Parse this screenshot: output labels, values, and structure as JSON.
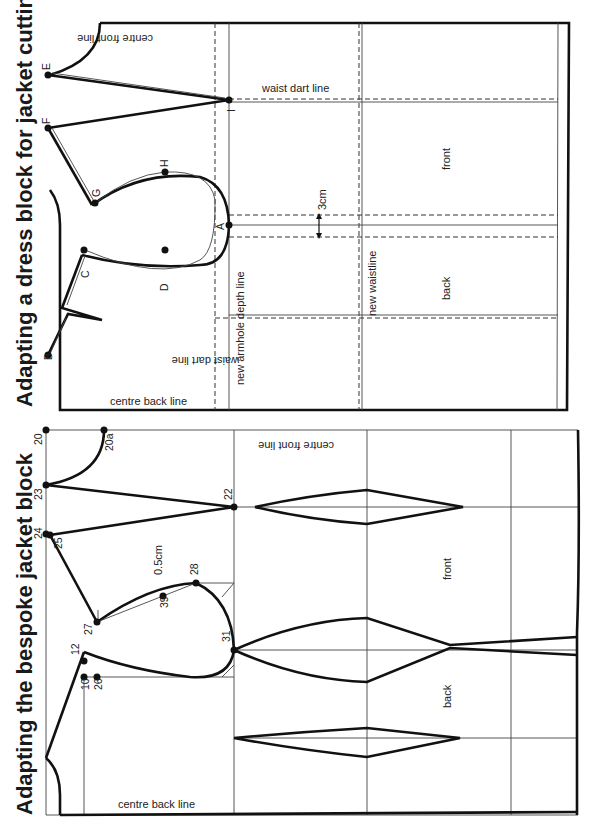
{
  "page_number": "15",
  "figures": [
    {
      "title": "Adapting a dress block for jacket cutting",
      "labels": {
        "centre_back_line": "centre back line",
        "centre_front_line": "centre front line",
        "waist_dart_line_front": "waist dart line",
        "waist_dart_line_back": "waist dart line",
        "new_armhole_depth_line": "new armhole depth line",
        "new_waistline": "new waistline",
        "front": "front",
        "back": "back",
        "measure": "3cm"
      },
      "points": {
        "A": "A",
        "B": "B",
        "C": "C",
        "D": "D",
        "E": "E",
        "F": "F",
        "G": "G",
        "H": "H",
        "I": "I"
      }
    },
    {
      "title": "Adapting the bespoke jacket block",
      "labels": {
        "centre_back_line": "centre back line",
        "centre_front_line": "centre front line",
        "front": "front",
        "back": "back",
        "measure": "0.5cm"
      },
      "points": {
        "p20": "20",
        "p20a": "20a",
        "p23": "23",
        "p22": "22",
        "p24": "24",
        "p25": "25",
        "p27": "27",
        "p28": "28",
        "p39": "39",
        "p31": "31",
        "p12": "12",
        "p10": "10",
        "p26": "26"
      }
    }
  ]
}
